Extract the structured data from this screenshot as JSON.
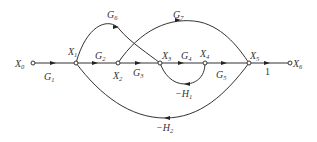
{
  "diagram": {
    "type": "signal-flow-graph",
    "nodes": [
      {
        "id": "X0",
        "label": "X",
        "sub": "0",
        "x": 33,
        "y": 63
      },
      {
        "id": "X1",
        "label": "X",
        "sub": "1",
        "x": 76,
        "y": 63
      },
      {
        "id": "X2",
        "label": "X",
        "sub": "2",
        "x": 118,
        "y": 63
      },
      {
        "id": "X3",
        "label": "X",
        "sub": "3",
        "x": 160,
        "y": 63
      },
      {
        "id": "X4",
        "label": "X",
        "sub": "4",
        "x": 205,
        "y": 63
      },
      {
        "id": "X5",
        "label": "X",
        "sub": "5",
        "x": 249,
        "y": 63
      },
      {
        "id": "X6",
        "label": "X",
        "sub": "6",
        "x": 290,
        "y": 63
      }
    ],
    "edges": [
      {
        "from": "X0",
        "to": "X1",
        "gain": "G",
        "sub": "1"
      },
      {
        "from": "X1",
        "to": "X2",
        "gain": "G",
        "sub": "2"
      },
      {
        "from": "X2",
        "to": "X3",
        "gain": "G",
        "sub": "3"
      },
      {
        "from": "X3",
        "to": "X4",
        "gain": "G",
        "sub": "4"
      },
      {
        "from": "X4",
        "to": "X5",
        "gain": "G",
        "sub": "5"
      },
      {
        "from": "X1",
        "to": "X3",
        "gain": "G",
        "sub": "6"
      },
      {
        "from": "X2",
        "to": "X5",
        "gain": "G",
        "sub": "7"
      },
      {
        "from": "X4",
        "to": "X3",
        "gain": "−H",
        "sub": "1"
      },
      {
        "from": "X5",
        "to": "X1",
        "gain": "−H",
        "sub": "2"
      },
      {
        "from": "X5",
        "to": "X6",
        "gain": "1",
        "sub": ""
      }
    ]
  }
}
